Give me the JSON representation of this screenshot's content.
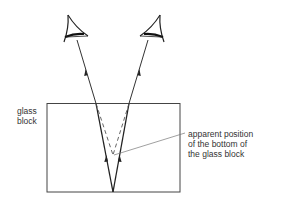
{
  "diagram": {
    "title": "",
    "labels": {
      "glass_block": [
        "glass",
        "block"
      ],
      "apparent_position": [
        "apparent position",
        "of the bottom of",
        "the glass block"
      ]
    },
    "elements": {
      "glass_block": {
        "x": 47,
        "y": 103,
        "width": 133,
        "height": 89
      },
      "real_vertex": {
        "x": 113,
        "y": 192
      },
      "apparent_vertex": {
        "x": 113,
        "y": 155
      },
      "left_ray_top_crossing": {
        "x": 96,
        "y": 103
      },
      "right_ray_top_crossing": {
        "x": 129,
        "y": 103
      },
      "left_eye": {
        "x": 72,
        "y": 30
      },
      "right_eye": {
        "x": 156,
        "y": 30
      }
    },
    "colors": {
      "stroke": "#333333",
      "leader": "#777777",
      "background": "#ffffff"
    }
  }
}
